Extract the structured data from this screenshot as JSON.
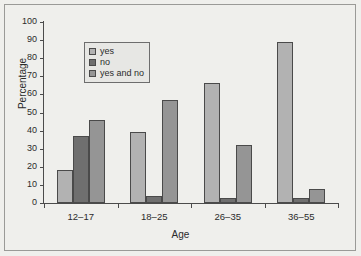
{
  "chart_data": {
    "type": "bar",
    "title": "",
    "xlabel": "Age",
    "ylabel": "Percentage",
    "ylim": [
      0,
      100
    ],
    "yticks": [
      0,
      10,
      20,
      30,
      40,
      50,
      60,
      70,
      80,
      90,
      100
    ],
    "categories": [
      "12–17",
      "18–25",
      "26–35",
      "36–55"
    ],
    "grid": false,
    "legend_position": "upper-left-inside",
    "series": [
      {
        "name": "yes",
        "color": "#b2b2b2",
        "values": [
          18,
          39,
          66.5,
          89
        ]
      },
      {
        "name": "no",
        "color": "#6f6f6f",
        "values": [
          37,
          4,
          2.5,
          2.5
        ]
      },
      {
        "name": "yes and no",
        "color": "#959595",
        "values": [
          46,
          57,
          32,
          8
        ]
      }
    ]
  },
  "legend": {
    "entries": [
      {
        "label": "yes"
      },
      {
        "label": "no"
      },
      {
        "label": "yes and no"
      }
    ]
  },
  "axes": {
    "y_title": "Percentage",
    "x_title": "Age",
    "y_tick_labels": [
      "0",
      "10",
      "20",
      "30",
      "40",
      "50",
      "60",
      "70",
      "80",
      "90",
      "100"
    ],
    "x_tick_labels": [
      "12–17",
      "18–25",
      "26–35",
      "36–55"
    ]
  },
  "style": {
    "background": "#efefec",
    "axis_color": "#4b4b4b",
    "frame_color": "#9a9a97",
    "bar_edge": "#4a4a4a"
  }
}
